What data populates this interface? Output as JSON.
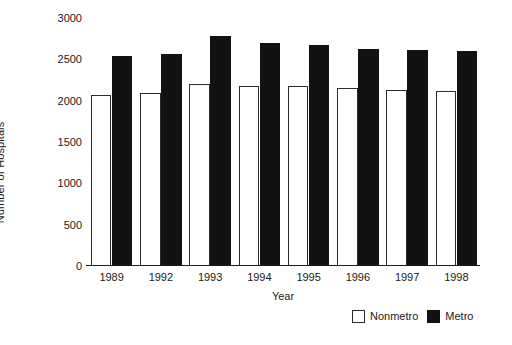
{
  "chart_data": {
    "type": "bar",
    "title": "",
    "xlabel": "Year",
    "ylabel": "Number of Hospitals",
    "categories": [
      "1989",
      "1992",
      "1993",
      "1994",
      "1995",
      "1996",
      "1997",
      "1998"
    ],
    "series": [
      {
        "name": "Nonmetro",
        "color": "#ffffff",
        "values": [
          2070,
          2090,
          2200,
          2180,
          2180,
          2150,
          2130,
          2120
        ]
      },
      {
        "name": "Metro",
        "color": "#121212",
        "values": [
          2540,
          2570,
          2780,
          2700,
          2670,
          2630,
          2610,
          2600
        ]
      }
    ],
    "ylim": [
      0,
      3000
    ],
    "yticks": [
      0,
      500,
      1000,
      1500,
      2000,
      2500,
      3000
    ],
    "ytick_labels": [
      "0",
      "500",
      "1000",
      "1500",
      "2000",
      "2500",
      "3000"
    ],
    "grid": false,
    "legend_position": "bottom-right"
  },
  "legend": {
    "entries": [
      {
        "label": "Nonmetro",
        "swatch": "open-square-icon"
      },
      {
        "label": "Metro",
        "swatch": "filled-square-icon"
      }
    ]
  },
  "axes": {
    "x_title": "Year",
    "y_title": "Number of Hospitals"
  }
}
